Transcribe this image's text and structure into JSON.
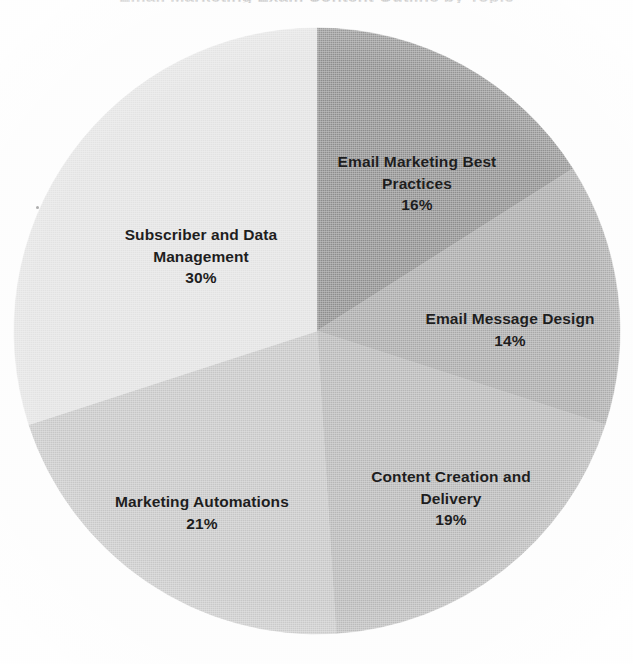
{
  "document": {
    "title_remnant": "Email Marketing Exam Content Outline by Topic",
    "background_color": "#fdfdfd"
  },
  "chart_data": {
    "type": "pie",
    "title": "Email Marketing Exam Content Outline by Topic",
    "xlabel": "",
    "ylabel": "",
    "legend_position": "none",
    "labels_inside_slices": true,
    "start_angle_deg": 0,
    "direction": "clockwise",
    "categories": [
      "Email Marketing Best Practices",
      "Email Message Design",
      "Content Creation and Delivery",
      "Marketing Automations",
      "Subscriber and Data Management"
    ],
    "values": [
      16,
      14,
      19,
      21,
      30
    ],
    "value_unit": "%",
    "colors": [
      "#8d8d8d",
      "#a8a8a8",
      "#b6b6b6",
      "#c6c6c6",
      "#e2e2e2"
    ],
    "slices": [
      {
        "label": "Email Marketing Best Practices",
        "label_line1": "Email Marketing Best",
        "label_line2": "Practices",
        "value": 16,
        "percent_text": "16%",
        "color": "#8d8d8d",
        "start_angle_deg": 0,
        "end_angle_deg": 57.6
      },
      {
        "label": "Email Message Design",
        "label_line1": "Email Message Design",
        "label_line2": "",
        "value": 14,
        "percent_text": "14%",
        "color": "#a8a8a8",
        "start_angle_deg": 57.6,
        "end_angle_deg": 108.0
      },
      {
        "label": "Content Creation and Delivery",
        "label_line1": "Content Creation and",
        "label_line2": "Delivery",
        "value": 19,
        "percent_text": "19%",
        "color": "#b6b6b6",
        "start_angle_deg": 108.0,
        "end_angle_deg": 176.4
      },
      {
        "label": "Marketing Automations",
        "label_line1": "Marketing Automations",
        "label_line2": "",
        "value": 21,
        "percent_text": "21%",
        "color": "#c6c6c6",
        "start_angle_deg": 176.4,
        "end_angle_deg": 252.0
      },
      {
        "label": "Subscriber and Data Management",
        "label_line1": "Subscriber and Data",
        "label_line2": "Management",
        "value": 30,
        "percent_text": "30%",
        "color": "#e2e2e2",
        "start_angle_deg": 252.0,
        "end_angle_deg": 360.0
      }
    ],
    "geometry": {
      "center_x": 317,
      "center_y": 331,
      "radius": 303
    }
  }
}
